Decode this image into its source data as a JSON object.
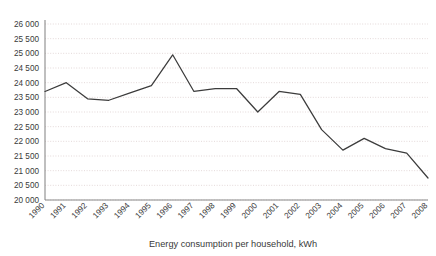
{
  "chart_data": {
    "type": "line",
    "title": "",
    "xlabel": "Energy consumption per household, kWh",
    "ylabel": "",
    "categories": [
      "1990",
      "1991",
      "1992",
      "1993",
      "1994",
      "1995",
      "1996",
      "1997",
      "1998",
      "1999",
      "2000",
      "2001",
      "2002",
      "2003",
      "2004",
      "2005",
      "2006",
      "2007",
      "2008"
    ],
    "values": [
      23700,
      24000,
      23450,
      23400,
      23650,
      23900,
      24950,
      23700,
      23800,
      23800,
      23000,
      23700,
      23600,
      22400,
      21700,
      22100,
      21750,
      21600,
      20750
    ],
    "series": [
      {
        "name": "Energy consumption per household, kWh",
        "values": [
          23700,
          24000,
          23450,
          23400,
          23650,
          23900,
          24950,
          23700,
          23800,
          23800,
          23000,
          23700,
          23600,
          22400,
          21700,
          22100,
          21750,
          21600,
          20750
        ]
      }
    ],
    "ylim": [
      20000,
      26000
    ],
    "ytick_step": 500,
    "ytick_labels": [
      "26 000",
      "25 500",
      "25 000",
      "24 500",
      "24 000",
      "23 500",
      "23 000",
      "22 500",
      "22 000",
      "21 500",
      "21 000",
      "20 500",
      "20 000"
    ],
    "ytick_values": [
      26000,
      25500,
      25000,
      24500,
      24000,
      23500,
      23000,
      22500,
      22000,
      21500,
      21000,
      20500,
      20000
    ],
    "grid": true,
    "grid_axis": "y",
    "legend": false,
    "legend_position": "none",
    "line_color": "#3c3c3c",
    "grid_color": "#d8c9c9",
    "axis_color": "#8a8a8a",
    "background_color": "#ffffff"
  }
}
